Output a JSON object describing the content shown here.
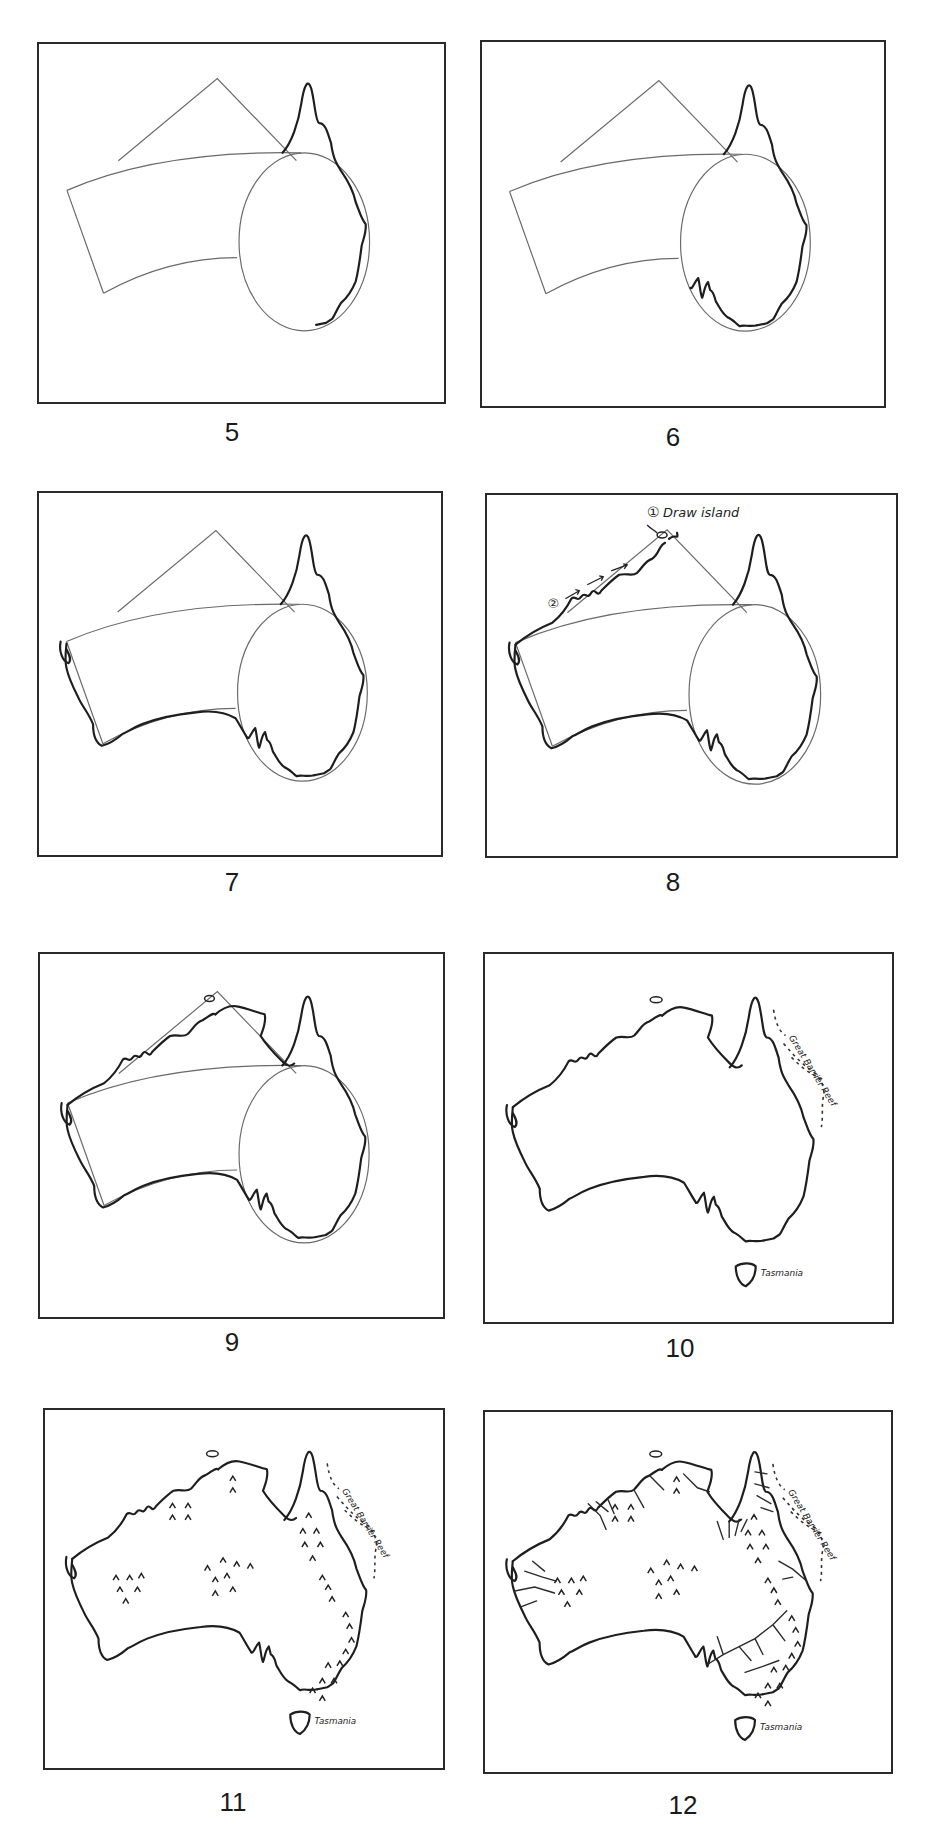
{
  "figure": {
    "panels": [
      {
        "step": "5",
        "stage": "shape guides with east coast (Cape York) outlined"
      },
      {
        "step": "6",
        "stage": "south-east coast and Spencer Gulf added"
      },
      {
        "step": "7",
        "stage": "south and west coasts traced"
      },
      {
        "step": "8",
        "stage": "north-west coast with annotations"
      },
      {
        "step": "9",
        "stage": "full coastline traced over guides"
      },
      {
        "step": "10",
        "stage": "clean outline with reef and Tasmania"
      },
      {
        "step": "11",
        "stage": "mountain ranges added"
      },
      {
        "step": "12",
        "stage": "rivers added"
      }
    ],
    "annotations": {
      "step_one": "①",
      "draw_island": "Draw island",
      "step_two": "②",
      "great_barrier_reef": "Great Barrier Reef",
      "tasmania": "Tasmania"
    },
    "colors": {
      "line": "#1e1e1e",
      "guide": "#6a6a6a",
      "background": "#ffffff"
    }
  }
}
